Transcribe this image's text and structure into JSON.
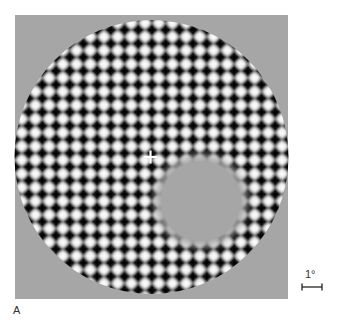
{
  "figure": {
    "panel_label": "A",
    "scale_bar": {
      "label": "1°"
    },
    "stimulus": {
      "description": "Circular plaid/checkerboard grating with fixation cross and a uniform gray disk occluding the lower-right region",
      "background_color": "#a6a6a6",
      "dark_spot_color": "#000000",
      "light_spot_color": "#ffffff",
      "fixation_cross_color": "#ffffff",
      "period_px": 13.7
    }
  }
}
